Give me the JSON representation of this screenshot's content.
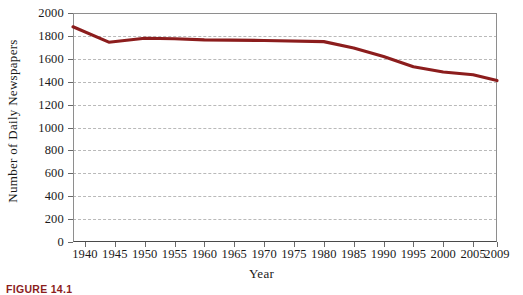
{
  "figure": {
    "caption": "FIGURE 14.1"
  },
  "chart_data": {
    "type": "line",
    "title": "",
    "xlabel": "Year",
    "ylabel": "Number of Daily Newspapers",
    "xlim": [
      1938,
      2009
    ],
    "ylim": [
      0,
      2000
    ],
    "ytick_step": 200,
    "grid": true,
    "legend": null,
    "series_color": "#8c1d1d",
    "y_ticks": [
      0,
      200,
      400,
      600,
      800,
      1000,
      1200,
      1400,
      1600,
      1800,
      2000
    ],
    "y_tick_labels": [
      "0",
      "200",
      "400",
      "600",
      "800",
      "1000",
      "1200",
      "1400",
      "1600",
      "1800",
      "2000"
    ],
    "x_ticks": [
      1940,
      1945,
      1950,
      1955,
      1960,
      1965,
      1970,
      1975,
      1980,
      1985,
      1990,
      1995,
      2000,
      2005,
      2009
    ],
    "x_tick_labels": [
      "1940",
      "1945",
      "1950",
      "1955",
      "1960",
      "1965",
      "1970",
      "1975",
      "1980",
      "1985",
      "1990",
      "1995",
      "2000",
      "2005",
      "2009"
    ],
    "x": [
      1938,
      1944,
      1950,
      1955,
      1960,
      1970,
      1980,
      1985,
      1990,
      1995,
      2000,
      2005,
      2009
    ],
    "values": [
      1880,
      1745,
      1780,
      1775,
      1765,
      1760,
      1750,
      1695,
      1620,
      1530,
      1485,
      1460,
      1410
    ]
  }
}
